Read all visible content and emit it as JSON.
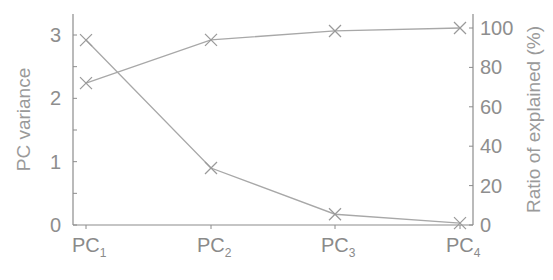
{
  "chart_data": {
    "type": "line",
    "title": "",
    "categories": [
      "PC1",
      "PC2",
      "PC3",
      "PC4"
    ],
    "category_labels": [
      {
        "main": "PC",
        "sub": "1"
      },
      {
        "main": "PC",
        "sub": "2"
      },
      {
        "main": "PC",
        "sub": "3"
      },
      {
        "main": "PC",
        "sub": "4"
      }
    ],
    "xlabel": "",
    "ylabel": "PC variance",
    "ylabel_right": "Ratio of explained (%)",
    "ylim": [
      0,
      3.2
    ],
    "ylim_right": [
      0,
      103
    ],
    "yticks": [
      0,
      1,
      2,
      3
    ],
    "yticks_right": [
      0,
      20,
      40,
      60,
      80,
      100
    ],
    "grid": false,
    "legend": null,
    "series": [
      {
        "name": "PC variance",
        "axis": "left",
        "marker": "x",
        "values": [
          2.92,
          0.9,
          0.17,
          0.03
        ]
      },
      {
        "name": "Cumulative ratio of explained variance (%)",
        "axis": "right",
        "marker": "x",
        "values": [
          72,
          94,
          98.5,
          100
        ]
      }
    ],
    "colors": {
      "line": "#a8a8a8",
      "axis": "#8c8c8c",
      "marker": "#9a9a9a"
    }
  }
}
